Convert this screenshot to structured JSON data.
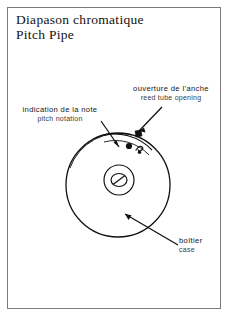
{
  "document": {
    "title_fr": "Diapason  chromatique",
    "title_en": "Pitch  Pipe"
  },
  "callouts": [
    {
      "id": "reed-tube-opening",
      "fr": "ouverture  de  l’anche",
      "en": "reed  tube  opening"
    },
    {
      "id": "pitch-notation",
      "fr": "indication  de  la  note",
      "en": "pitch  notation"
    },
    {
      "id": "case",
      "fr": "boîtier",
      "en": "case"
    }
  ],
  "diagram": {
    "type": "technical-illustration",
    "parts": [
      "outer-disc-circle",
      "inner-hub-circle",
      "center-screw",
      "reed-tube-opening-arc",
      "note-marking-dot",
      "note-marking-glyph"
    ],
    "colors": {
      "ink": "#111111",
      "paper": "#ffffff",
      "frame": "#7a7a7a"
    }
  }
}
